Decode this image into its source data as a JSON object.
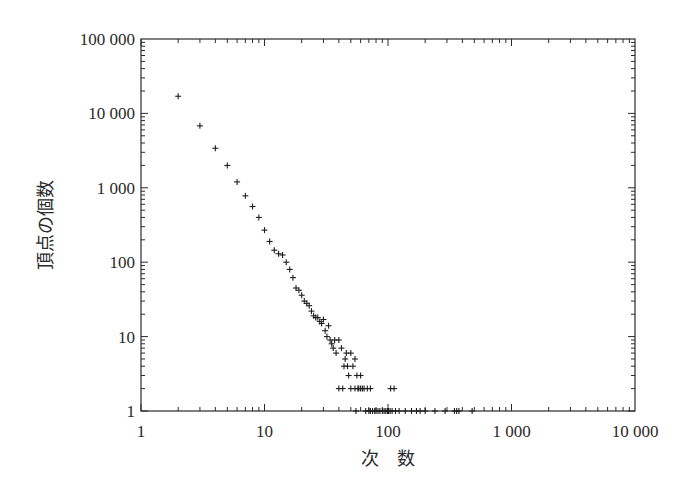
{
  "chart_data": {
    "type": "scatter",
    "title": "",
    "xlabel": "次　数",
    "ylabel": "頂点の個数",
    "xscale": "log",
    "yscale": "log",
    "xlim": [
      1,
      10000
    ],
    "ylim": [
      1,
      100000
    ],
    "grid": false,
    "legend": null,
    "marker": "+",
    "x_ticks": [
      {
        "value": 1,
        "label": "1"
      },
      {
        "value": 10,
        "label": "10"
      },
      {
        "value": 100,
        "label": "100"
      },
      {
        "value": 1000,
        "label": "1 000"
      },
      {
        "value": 10000,
        "label": "10 000"
      }
    ],
    "y_ticks": [
      {
        "value": 1,
        "label": "1"
      },
      {
        "value": 10,
        "label": "10"
      },
      {
        "value": 100,
        "label": "100"
      },
      {
        "value": 1000,
        "label": "1 000"
      },
      {
        "value": 10000,
        "label": "10 000"
      },
      {
        "value": 100000,
        "label": "100 000"
      }
    ],
    "points": [
      [
        2,
        17000
      ],
      [
        3,
        6800
      ],
      [
        4,
        3400
      ],
      [
        5,
        2000
      ],
      [
        6,
        1200
      ],
      [
        7,
        780
      ],
      [
        8,
        560
      ],
      [
        9,
        400
      ],
      [
        10,
        270
      ],
      [
        11,
        190
      ],
      [
        12,
        145
      ],
      [
        13,
        130
      ],
      [
        14,
        125
      ],
      [
        15,
        100
      ],
      [
        16,
        80
      ],
      [
        17,
        62
      ],
      [
        18,
        45
      ],
      [
        19,
        42
      ],
      [
        20,
        36
      ],
      [
        21,
        30
      ],
      [
        22,
        28
      ],
      [
        23,
        26
      ],
      [
        24,
        22
      ],
      [
        25,
        19
      ],
      [
        26,
        18
      ],
      [
        27,
        18
      ],
      [
        28,
        16
      ],
      [
        29,
        15
      ],
      [
        30,
        17
      ],
      [
        31,
        12
      ],
      [
        32,
        10
      ],
      [
        33,
        14
      ],
      [
        34,
        9
      ],
      [
        35,
        8
      ],
      [
        36,
        7
      ],
      [
        37,
        9
      ],
      [
        38,
        6
      ],
      [
        40,
        9
      ],
      [
        42,
        7
      ],
      [
        44,
        4
      ],
      [
        45,
        5
      ],
      [
        46,
        6
      ],
      [
        47,
        4
      ],
      [
        48,
        3
      ],
      [
        50,
        6
      ],
      [
        52,
        4
      ],
      [
        54,
        5
      ],
      [
        56,
        3
      ],
      [
        60,
        3
      ],
      [
        40,
        2
      ],
      [
        43,
        2
      ],
      [
        50,
        2
      ],
      [
        54,
        2
      ],
      [
        57,
        2
      ],
      [
        58,
        2
      ],
      [
        60,
        2
      ],
      [
        62,
        2
      ],
      [
        64,
        2
      ],
      [
        68,
        2
      ],
      [
        72,
        2
      ],
      [
        105,
        2
      ],
      [
        112,
        2
      ],
      [
        55,
        1
      ],
      [
        66,
        1
      ],
      [
        70,
        1
      ],
      [
        72,
        1
      ],
      [
        75,
        1
      ],
      [
        78,
        1
      ],
      [
        80,
        1
      ],
      [
        83,
        1
      ],
      [
        86,
        1
      ],
      [
        90,
        1
      ],
      [
        93,
        1
      ],
      [
        96,
        1
      ],
      [
        99,
        1
      ],
      [
        101,
        1
      ],
      [
        104,
        1
      ],
      [
        108,
        1
      ],
      [
        115,
        1
      ],
      [
        123,
        1
      ],
      [
        138,
        1
      ],
      [
        155,
        1
      ],
      [
        170,
        1
      ],
      [
        182,
        1
      ],
      [
        200,
        1
      ],
      [
        240,
        1
      ],
      [
        290,
        1
      ],
      [
        345,
        1
      ],
      [
        360,
        1
      ],
      [
        375,
        1
      ],
      [
        480,
        1
      ]
    ]
  }
}
